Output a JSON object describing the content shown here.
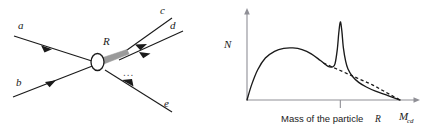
{
  "figure": {
    "panels": [
      {
        "name": "feynman-like-scattering-diagram",
        "description": "Two incoming particles a and b annihilate at a blob vertex producing an intermediate resonance R which decays into outgoing particles c, d, ... and e",
        "vertex_label": "R",
        "incoming": [
          {
            "id": "a",
            "label": "a"
          },
          {
            "id": "b",
            "label": "b"
          }
        ],
        "outgoing": [
          {
            "id": "c",
            "label": "c"
          },
          {
            "id": "d",
            "label": "d"
          },
          {
            "id": "e",
            "label": "e"
          }
        ],
        "ellipsis": "...",
        "colors": {
          "line": "#1a1a1a",
          "resonance": "#9a9a9a",
          "blob_fill": "#ffffff",
          "blob_stroke": "#1a1a1a"
        }
      },
      {
        "name": "invariant-mass-spectrum-plot",
        "axis": {
          "y_label": "N",
          "x_label_main": "M",
          "x_label_sub": "cd"
        },
        "tick_caption_prefix": "Mass of the particle ",
        "tick_caption_symbol": "R",
        "legend_notes": {
          "solid_curve": "Measured spectrum with resonance peak",
          "dashed_curve": "Smooth combinatorial background"
        },
        "colors": {
          "axis": "#8f8f96",
          "curve": "#1a1a1a",
          "background_curve": "#1a1a1a"
        }
      }
    ]
  },
  "chart_data": {
    "type": "line",
    "title": "",
    "xlabel": "M_cd",
    "ylabel": "N",
    "xlim": [
      0,
      1
    ],
    "ylim": [
      0,
      1
    ],
    "grid": false,
    "legend": "none",
    "annotations": [
      {
        "text": "Mass of the particle R",
        "x": 0.61,
        "y": 0.0,
        "type": "tick-caption"
      }
    ],
    "ticks": {
      "x": [
        0.61
      ],
      "y": []
    },
    "series": [
      {
        "name": "Spectrum with resonance",
        "style": "solid",
        "x": [
          0.0,
          0.03,
          0.07,
          0.12,
          0.18,
          0.24,
          0.3,
          0.36,
          0.42,
          0.48,
          0.53,
          0.56,
          0.575,
          0.59,
          0.6,
          0.61,
          0.62,
          0.63,
          0.645,
          0.66,
          0.69,
          0.73,
          0.78,
          0.84,
          0.91,
          0.97,
          1.0
        ],
        "y": [
          0.0,
          0.18,
          0.36,
          0.5,
          0.58,
          0.615,
          0.62,
          0.6,
          0.55,
          0.47,
          0.4,
          0.395,
          0.43,
          0.6,
          0.8,
          0.93,
          0.82,
          0.62,
          0.46,
          0.37,
          0.28,
          0.21,
          0.155,
          0.105,
          0.06,
          0.02,
          0.0
        ]
      },
      {
        "name": "Background (no resonance)",
        "style": "dashed",
        "x": [
          0.5,
          0.58,
          0.66,
          0.74,
          0.82,
          0.9,
          1.0
        ],
        "y": [
          0.44,
          0.375,
          0.31,
          0.245,
          0.18,
          0.1,
          0.0
        ]
      }
    ]
  }
}
